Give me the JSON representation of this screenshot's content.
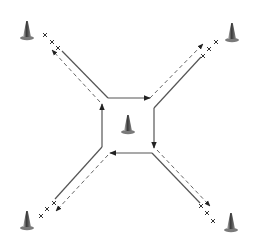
{
  "diagram": {
    "type": "drill-layout",
    "colors": {
      "solid_line": "#555555",
      "dashed_line": "#666666",
      "arrow": "#222222",
      "cone_dark": "#3a3a3a",
      "cone_light": "#9a9a9a",
      "x_mark": "#333333"
    },
    "cones": [
      {
        "id": "top-left",
        "x": 27,
        "y": 38
      },
      {
        "id": "top-right",
        "x": 232,
        "y": 40
      },
      {
        "id": "bottom-left",
        "x": 27,
        "y": 228
      },
      {
        "id": "bottom-right",
        "x": 231,
        "y": 230
      },
      {
        "id": "center",
        "x": 128,
        "y": 132
      }
    ],
    "x_marks": {
      "glyph": "x",
      "top_left": [
        [
          45,
          35
        ],
        [
          52,
          42
        ],
        [
          58,
          48
        ]
      ],
      "top_right": [
        [
          216,
          42
        ],
        [
          209,
          49
        ],
        [
          203,
          56
        ]
      ],
      "bottom_left": [
        [
          54,
          203
        ],
        [
          47,
          209
        ],
        [
          41,
          216
        ]
      ],
      "bottom_right": [
        [
          201,
          206
        ],
        [
          207,
          213
        ],
        [
          213,
          221
        ]
      ]
    },
    "square": {
      "top": {
        "x1": 108,
        "y1": 98,
        "x2": 148,
        "y2": 98,
        "arrow": "right"
      },
      "right": {
        "x1": 154,
        "y1": 106,
        "x2": 154,
        "y2": 146,
        "arrow": "down"
      },
      "bottom": {
        "x1": 150,
        "y1": 153,
        "x2": 112,
        "y2": 153,
        "arrow": "left"
      },
      "left": {
        "x1": 102,
        "y1": 147,
        "x2": 102,
        "y2": 106,
        "arrow": "up"
      }
    }
  }
}
